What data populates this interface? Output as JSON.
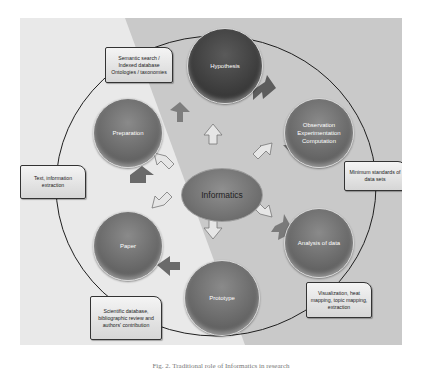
{
  "diagram": {
    "center": {
      "label": "Informatics"
    },
    "nodes": [
      {
        "id": "hypothesis",
        "label": "Hypothesis"
      },
      {
        "id": "observation",
        "label": "Observation Experimentation Computation"
      },
      {
        "id": "analysis",
        "label": "Analysis of data"
      },
      {
        "id": "prototype",
        "label": "Prototype"
      },
      {
        "id": "paper",
        "label": "Paper"
      },
      {
        "id": "preparation",
        "label": "Preparation"
      }
    ],
    "callouts": [
      {
        "id": "semantic",
        "label": "Semantic search / Indexed database Ontologies / taxonomies"
      },
      {
        "id": "minimum",
        "label": "Minimum standards of data sets"
      },
      {
        "id": "visualization",
        "label": "Visualization, heat mapping, topic mapping, extraction"
      },
      {
        "id": "scientific",
        "label": "Scientific database, bibliographic review and authors' contribution"
      },
      {
        "id": "text",
        "label": "Text, information extraction"
      }
    ],
    "caption": "Fig. 2. Traditional role of Informatics in research"
  },
  "colors": {
    "panel": "#e9e9e9",
    "diagonal": "#c8c8c8",
    "node": "#6a6a6a",
    "ring": "#1f1f1f"
  }
}
